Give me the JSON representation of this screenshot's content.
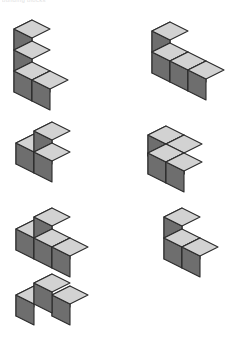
{
  "page": {
    "top_caption": "building blocks",
    "background_color": "#ffffff",
    "figure_count": 7
  },
  "palette": {
    "cube_top": "#d2d2d2",
    "cube_left": "#6e6e6e",
    "cube_right": "#c3c3c3",
    "outline": "#2b2b2b"
  },
  "geometry": {
    "cube_size": 21,
    "projection": "isometric",
    "dx": 18,
    "dy": 9
  },
  "figures": [
    {
      "id": 1,
      "name": "vertical-column-with-foot",
      "label": "1",
      "cube_count": 4,
      "position": {
        "left": 12,
        "top": 18
      },
      "cubes": [
        [
          0,
          0,
          0
        ],
        [
          0,
          0,
          1
        ],
        [
          0,
          0,
          2
        ],
        [
          1,
          0,
          0
        ]
      ]
    },
    {
      "id": 2,
      "name": "L-shape-two-tall-two-long",
      "label": "2",
      "cube_count": 4,
      "position": {
        "left": 150,
        "top": 20
      },
      "cubes": [
        [
          0,
          0,
          0
        ],
        [
          0,
          0,
          1
        ],
        [
          1,
          0,
          0
        ],
        [
          2,
          0,
          0
        ]
      ]
    },
    {
      "id": 3,
      "name": "two-base-one-on-right",
      "label": "3",
      "cube_count": 3,
      "position": {
        "left": 14,
        "top": 120
      },
      "cubes": [
        [
          0,
          0,
          0
        ],
        [
          1,
          0,
          0
        ],
        [
          1,
          0,
          1
        ]
      ]
    },
    {
      "id": 4,
      "name": "flat-s-zigzag",
      "label": "4",
      "cube_count": 4,
      "position": {
        "left": 146,
        "top": 124
      },
      "cubes": [
        [
          0,
          0,
          0
        ],
        [
          1,
          0,
          0
        ],
        [
          1,
          1,
          0
        ],
        [
          2,
          1,
          0
        ]
      ]
    },
    {
      "id": 5,
      "name": "three-row-one-on-middle",
      "label": "5",
      "cube_count": 4,
      "position": {
        "left": 14,
        "top": 206
      },
      "cubes": [
        [
          0,
          0,
          0
        ],
        [
          1,
          0,
          0
        ],
        [
          2,
          0,
          0
        ],
        [
          1,
          0,
          1
        ]
      ]
    },
    {
      "id": 6,
      "name": "two-tall-with-front-foot",
      "label": "6",
      "cube_count": 3,
      "position": {
        "left": 162,
        "top": 206
      },
      "cubes": [
        [
          0,
          0,
          0
        ],
        [
          0,
          0,
          1
        ],
        [
          1,
          0,
          0
        ]
      ]
    },
    {
      "id": 7,
      "name": "diagonal-three-corner",
      "label": "7",
      "cube_count": 3,
      "position": {
        "left": 14,
        "top": 272
      },
      "cubes": [
        [
          0,
          1,
          0
        ],
        [
          1,
          1,
          1
        ],
        [
          1,
          0,
          0
        ]
      ]
    }
  ]
}
